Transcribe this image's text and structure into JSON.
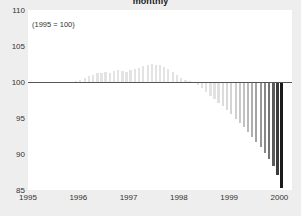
{
  "chart": {
    "title": "monthly",
    "annotation": "(1995 = 100)"
  },
  "axes": {
    "y_ticks": [
      "110",
      "105",
      "100",
      "95",
      "90",
      "85"
    ],
    "x_ticks": [
      "1995",
      "1996",
      "1997",
      "1998",
      "1999",
      "2000"
    ]
  },
  "colors": {
    "background": "#eeeeee",
    "plot_background": "#ffffff",
    "baseline": "#555555",
    "bar_light": "#e3e3e3",
    "bar_dark": "#1a1a1a",
    "text": "#333333"
  },
  "chart_data": {
    "type": "bar",
    "title": "monthly",
    "subtitle": "(1995 = 100)",
    "xlabel": "",
    "ylabel": "",
    "ylim": [
      85,
      110
    ],
    "xlim": [
      1995,
      2000.25
    ],
    "grid": false,
    "baseline": 100,
    "legend": null,
    "ytick_labels": [
      "110",
      "105",
      "100",
      "95",
      "90",
      "85"
    ],
    "ytick_values": [
      110,
      105,
      100,
      95,
      90,
      85
    ],
    "xtick_labels": [
      "1995",
      "1996",
      "1997",
      "1998",
      "1999",
      "2000"
    ],
    "xtick_values": [
      1995,
      1996,
      1997,
      1998,
      1999,
      2000
    ],
    "x": [
      1995.04,
      1995.13,
      1995.21,
      1995.29,
      1995.38,
      1995.46,
      1995.54,
      1995.63,
      1995.71,
      1995.79,
      1995.88,
      1995.96,
      1996.04,
      1996.13,
      1996.21,
      1996.29,
      1996.38,
      1996.46,
      1996.54,
      1996.63,
      1996.71,
      1996.79,
      1996.88,
      1996.96,
      1997.04,
      1997.13,
      1997.21,
      1997.29,
      1997.38,
      1997.46,
      1997.54,
      1997.63,
      1997.71,
      1997.79,
      1997.88,
      1997.96,
      1998.04,
      1998.13,
      1998.21,
      1998.29,
      1998.38,
      1998.46,
      1998.54,
      1998.63,
      1998.71,
      1998.79,
      1998.88,
      1998.96,
      1999.04,
      1999.13,
      1999.21,
      1999.29,
      1999.38,
      1999.46,
      1999.54,
      1999.63,
      1999.71,
      1999.79,
      1999.88,
      1999.96,
      2000.04
    ],
    "values": [
      100.0,
      100.0,
      100.0,
      100.0,
      100.0,
      100.0,
      100.0,
      100.0,
      100.0,
      100.0,
      100.0,
      100.1,
      100.3,
      100.5,
      100.8,
      101.0,
      101.2,
      101.3,
      101.4,
      101.3,
      101.5,
      101.6,
      101.5,
      101.4,
      101.6,
      101.8,
      102.0,
      102.2,
      102.4,
      102.5,
      102.4,
      102.3,
      102.1,
      101.8,
      101.4,
      101.0,
      100.6,
      100.3,
      100.1,
      100.0,
      99.6,
      99.1,
      98.6,
      98.1,
      97.6,
      97.1,
      96.6,
      96.1,
      95.5,
      94.9,
      94.3,
      93.7,
      93.1,
      92.4,
      91.7,
      91.0,
      90.2,
      89.3,
      88.3,
      87.1,
      85.3
    ]
  }
}
